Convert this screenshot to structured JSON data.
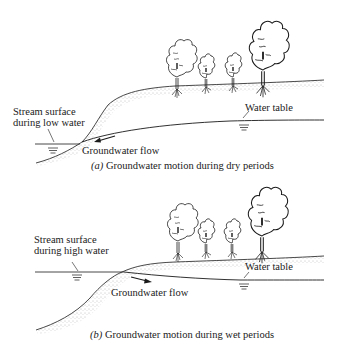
{
  "figures": [
    {
      "id": "a",
      "stream_label_line1": "Stream surface",
      "stream_label_line2": "during low water",
      "water_table_label": "Water table",
      "flow_label": "Groundwater flow",
      "caption_letter": "(a)",
      "caption_text": " Groundwater motion during dry periods"
    },
    {
      "id": "b",
      "stream_label_line1": "Stream surface",
      "stream_label_line2": "during high water",
      "water_table_label": "Water table",
      "flow_label": "Groundwater flow",
      "caption_letter": "(b)",
      "caption_text": " Groundwater motion during wet periods"
    }
  ],
  "colors": {
    "ink": "#1a1a1a",
    "stipple": "#8a8a8a",
    "background": "#ffffff"
  }
}
